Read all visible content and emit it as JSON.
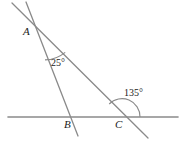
{
  "figure": {
    "background_color": "#ffffff",
    "line_color": "#8a8a8a",
    "arc_color": "#8a8a8a",
    "text_color": "#1a1a1a",
    "width": 183,
    "height": 143
  },
  "points": {
    "A": {
      "label": "A",
      "x": 33,
      "y": 29
    },
    "B": {
      "label": "B",
      "x": 70,
      "y": 117
    },
    "C": {
      "label": "C",
      "x": 122,
      "y": 117
    }
  },
  "angles": {
    "at_A": {
      "label": "25°",
      "value": 25,
      "vertex": "A"
    },
    "at_C": {
      "label": "135°",
      "value": 135,
      "vertex": "C"
    }
  },
  "segments": {
    "horizontal_line": {
      "x1": 8,
      "y1": 117,
      "x2": 178,
      "y2": 117
    },
    "line_through_AB": {
      "x1": 26,
      "y1": 2,
      "x2": 78,
      "y2": 136
    },
    "line_through_AC": {
      "x1": 12,
      "y1": 3,
      "x2": 148,
      "y2": 138
    }
  }
}
